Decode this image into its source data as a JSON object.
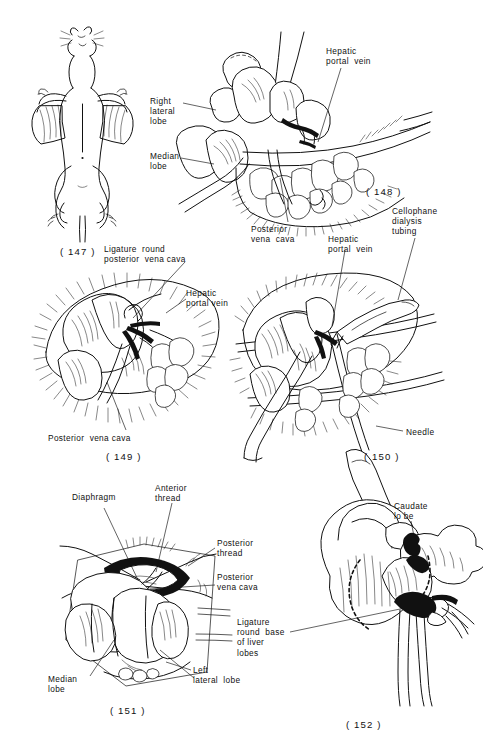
{
  "plate": {
    "title": "Rat liver surgical preparation plate",
    "background_color": "#ffffff",
    "ink_color": "#111111"
  },
  "figures": [
    {
      "id": "fig-147",
      "number": "( 147 )",
      "caption_pos": {
        "x": 60,
        "y": 246
      },
      "subject": "supine rat with ventral midline incision",
      "labels": []
    },
    {
      "id": "fig-148",
      "number": "( 148 )",
      "caption_pos": {
        "x": 366,
        "y": 186
      },
      "subject": "exposed liver lobes with retractor and viscera",
      "labels": [
        {
          "name": "hepatic-portal-vein",
          "text": "Hepatic\nportal  vein",
          "x": 326,
          "y": 46
        },
        {
          "name": "right-lateral-lobe",
          "text": "Right\nlateral\nlobe",
          "x": 150,
          "y": 96
        },
        {
          "name": "median-lobe",
          "text": "Median\nlobe",
          "x": 150,
          "y": 151
        },
        {
          "name": "posterior-vena-cava",
          "text": "Posterior\nvena  cava",
          "x": 251,
          "y": 224
        }
      ]
    },
    {
      "id": "fig-149",
      "number": "( 149 )",
      "caption_pos": {
        "x": 106,
        "y": 451
      },
      "subject": "ligature placed round the posterior vena cava",
      "labels": [
        {
          "name": "ligature-round-posterior-vena-cava",
          "text": "Ligature  round\nposterior  vena cava",
          "x": 104,
          "y": 244
        },
        {
          "name": "hepatic-portal-vein",
          "text": "Hepatic\nportal vein",
          "x": 186,
          "y": 288
        },
        {
          "name": "posterior-vena-cava",
          "text": "Posterior  vena cava",
          "x": 48,
          "y": 433
        }
      ]
    },
    {
      "id": "fig-150",
      "number": "( 150 )",
      "caption_pos": {
        "x": 364,
        "y": 451
      },
      "subject": "cellophane dialysis tubing and needle introduced into vessel",
      "labels": [
        {
          "name": "cellophane-dialysis-tubing",
          "text": "Cellophane\ndialysis\ntubing",
          "x": 392,
          "y": 206
        },
        {
          "name": "hepatic-portal-vein",
          "text": "Hepatic\nportal  vein",
          "x": 328,
          "y": 234
        },
        {
          "name": "needle",
          "text": "Needle",
          "x": 406,
          "y": 427
        }
      ]
    },
    {
      "id": "fig-151",
      "number": "( 151 )",
      "caption_pos": {
        "x": 110,
        "y": 705
      },
      "subject": "diaphragm opened showing threads round posterior vena cava",
      "labels": [
        {
          "name": "diaphragm",
          "text": "Diaphragm",
          "x": 72,
          "y": 492
        },
        {
          "name": "anterior-thread",
          "text": "Anterior\nthread",
          "x": 155,
          "y": 483
        },
        {
          "name": "posterior-thread",
          "text": "Posterior\nthread",
          "x": 217,
          "y": 538
        },
        {
          "name": "posterior-vena-cava",
          "text": "Posterior\nvena cava",
          "x": 217,
          "y": 572
        },
        {
          "name": "ligature-round-base-of-liver-lobes",
          "text": "Ligature\nround  base\nof liver\nlobes",
          "x": 237,
          "y": 617
        },
        {
          "name": "median-lobe",
          "text": "Median\nlobe",
          "x": 48,
          "y": 674
        },
        {
          "name": "left-lateral-lobe",
          "text": "Left\nlateral  lobe",
          "x": 193,
          "y": 665
        }
      ]
    },
    {
      "id": "fig-152",
      "number": "( 152 )",
      "caption_pos": {
        "x": 346,
        "y": 719
      },
      "subject": "isolated liver showing caudate lobe and ligature at lobe base",
      "labels": [
        {
          "name": "caudate-lobe",
          "text": "Caudate\nlo be",
          "x": 394,
          "y": 501
        }
      ]
    }
  ]
}
